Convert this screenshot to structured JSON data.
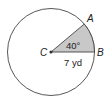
{
  "diagram": {
    "type": "circle-sector",
    "center_label": "C",
    "point_a_label": "A",
    "point_b_label": "B",
    "angle_label": "40°",
    "radius_label": "7 yd",
    "angle_degrees": 40,
    "radius_value": 7,
    "radius_unit": "yd",
    "colors": {
      "circle_stroke": "#444444",
      "sector_fill": "#c8c8c8",
      "text": "#222222"
    }
  }
}
